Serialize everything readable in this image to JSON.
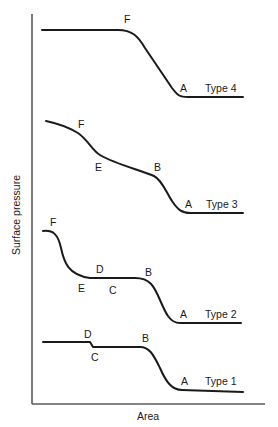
{
  "figure": {
    "axes": {
      "x_label": "Area",
      "y_label": "Surface pressure"
    },
    "curves": [
      {
        "name": "Type 4",
        "points": {
          "F": "F",
          "A": "A"
        }
      },
      {
        "name": "Type 3",
        "points": {
          "F": "F",
          "E": "E",
          "B": "B",
          "A": "A"
        }
      },
      {
        "name": "Type 2",
        "points": {
          "F": "F",
          "E": "E",
          "D": "D",
          "C": "C",
          "B": "B",
          "A": "A"
        }
      },
      {
        "name": "Type 1",
        "points": {
          "D": "D",
          "C": "C",
          "B": "B",
          "A": "A"
        }
      }
    ]
  },
  "colors": {
    "line": "#1a1a1a",
    "axis": "#5a5a5a",
    "background": "#ffffff"
  }
}
